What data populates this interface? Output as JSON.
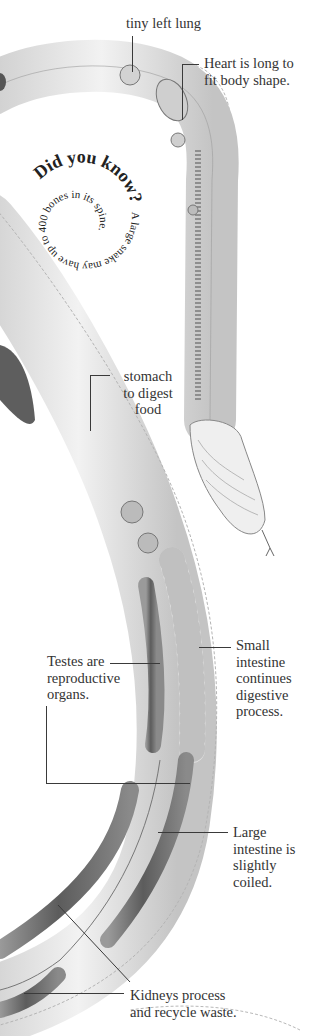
{
  "diagram": {
    "labels": {
      "lung": "tiny left lung",
      "heart_1": "Heart is long to",
      "heart_2": "fit body shape.",
      "stomach_1": "stomach",
      "stomach_2": "to digest",
      "stomach_3": "food",
      "small_int_1": "Small",
      "small_int_2": "intestine",
      "small_int_3": "continues",
      "small_int_4": "digestive",
      "small_int_5": "process.",
      "testes_1": "Testes are",
      "testes_2": "reproductive",
      "testes_3": "organs.",
      "large_int_1": "Large",
      "large_int_2": "intestine is",
      "large_int_3": "slightly",
      "large_int_4": "coiled.",
      "kidneys_1": "Kidneys process",
      "kidneys_2": "and recycle waste."
    },
    "did_you_know": {
      "heading": "Did you know?",
      "fact": "A large snake may have up to 400 bones in its spine."
    },
    "colors": {
      "body_fill": "#e9e9e9",
      "body_shade": "#bdbdbd",
      "organ_dark": "#6e6e6e",
      "text": "#333333",
      "leader": "#3a3a3a"
    }
  }
}
